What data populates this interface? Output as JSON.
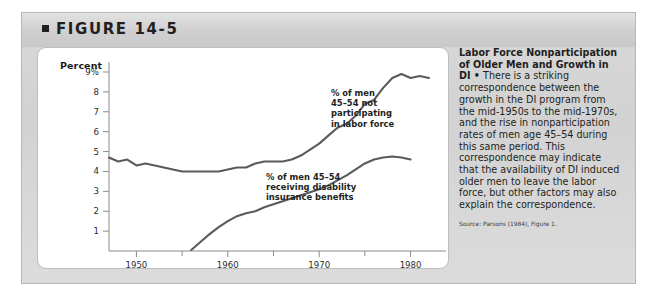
{
  "figure": {
    "number_label": "FIGURE 14-5",
    "bullet_icon": "square-bullet-icon"
  },
  "sidebar_text": {
    "title_line1": "Labor Force Nonparticipation",
    "title_line2": "of Older Men and Growth in DI •",
    "body": "There is a striking correspondence between the growth in the DI program from the mid-1950s to the mid-1970s, and the rise in nonparticipation rates of men age 45–54 during this same period. This correspondence may indicate that the availability of DI induced older men to leave the labor force, but other factors may also explain the correspondence.",
    "source": "Source: Parsons (1984), Figure 1."
  },
  "callouts": {
    "upper": "% of men\n45–54 not\nparticipating\nin labor force",
    "lower": "% of men 45–54\nreceiving disability\ninsurance benefits"
  },
  "chart_data": {
    "type": "line",
    "title": "",
    "xlabel": "",
    "ylabel": "Percent",
    "ylim": [
      0,
      9
    ],
    "xlim": [
      1947,
      1983
    ],
    "grid": false,
    "legend_position": "inline-callouts",
    "ytick_labels": [
      "9%",
      "8",
      "7",
      "6",
      "5",
      "4",
      "3",
      "2",
      "1"
    ],
    "ytick_values": [
      9,
      8,
      7,
      6,
      5,
      4,
      3,
      2,
      1
    ],
    "xtick_labels": [
      "1950",
      "1960",
      "1970",
      "1980"
    ],
    "xtick_values": [
      1950,
      1960,
      1970,
      1980
    ],
    "xminor_ticks": [
      1955,
      1965,
      1975
    ],
    "series": [
      {
        "name": "% of men 45–54 not participating in labor force",
        "color": "#5a5a5a",
        "x": [
          1947,
          1948,
          1949,
          1950,
          1951,
          1952,
          1953,
          1954,
          1955,
          1956,
          1957,
          1958,
          1959,
          1960,
          1961,
          1962,
          1963,
          1964,
          1965,
          1966,
          1967,
          1968,
          1969,
          1970,
          1971,
          1972,
          1973,
          1974,
          1975,
          1976,
          1977,
          1978,
          1979,
          1980,
          1981,
          1982
        ],
        "values": [
          4.7,
          4.5,
          4.6,
          4.3,
          4.4,
          4.3,
          4.2,
          4.1,
          4.0,
          4.0,
          4.0,
          4.0,
          4.0,
          4.1,
          4.2,
          4.2,
          4.4,
          4.5,
          4.5,
          4.5,
          4.6,
          4.8,
          5.1,
          5.4,
          5.8,
          6.2,
          6.4,
          6.8,
          7.4,
          7.6,
          8.2,
          8.7,
          8.9,
          8.7,
          8.8,
          8.7
        ]
      },
      {
        "name": "% of men 45–54 receiving disability insurance benefits",
        "color": "#5a5a5a",
        "x": [
          1956,
          1957,
          1958,
          1959,
          1960,
          1961,
          1962,
          1963,
          1964,
          1965,
          1966,
          1967,
          1968,
          1969,
          1970,
          1971,
          1972,
          1973,
          1974,
          1975,
          1976,
          1977,
          1978,
          1979,
          1980
        ],
        "values": [
          0.05,
          0.45,
          0.85,
          1.2,
          1.5,
          1.75,
          1.9,
          2.0,
          2.2,
          2.35,
          2.5,
          2.65,
          2.8,
          2.95,
          3.1,
          3.3,
          3.55,
          3.8,
          4.1,
          4.4,
          4.6,
          4.7,
          4.75,
          4.7,
          4.6
        ]
      }
    ]
  }
}
